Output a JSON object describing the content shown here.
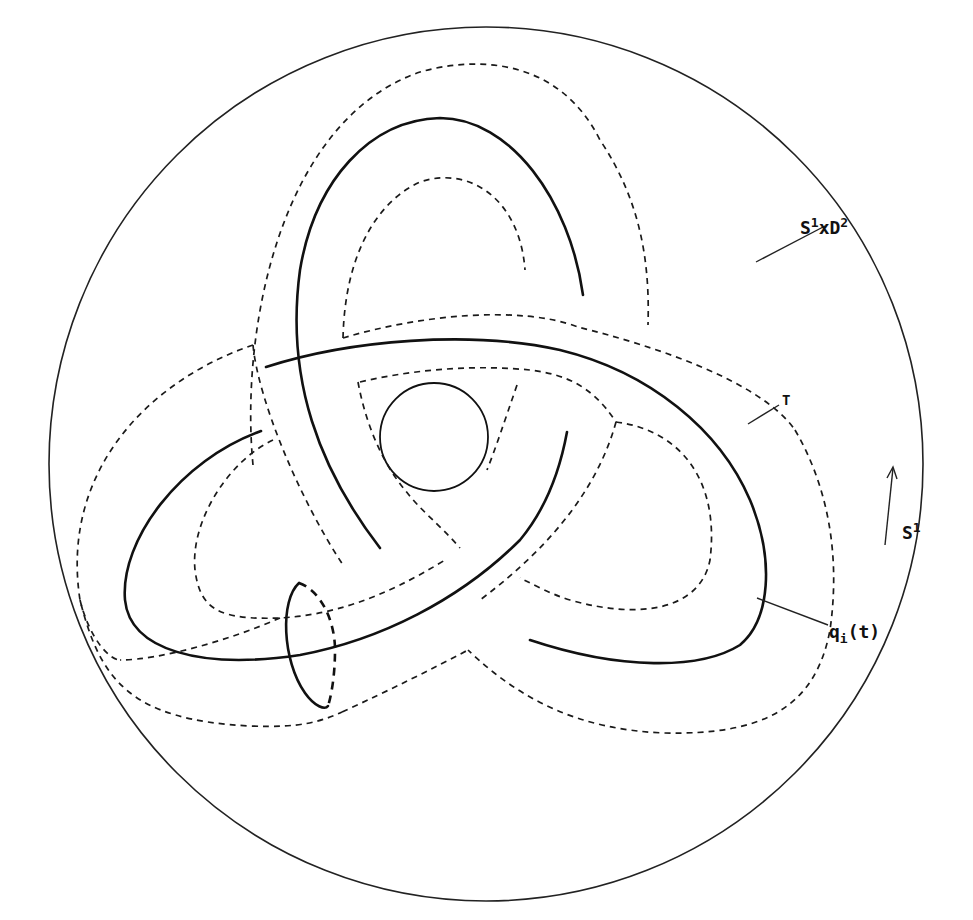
{
  "figure": {
    "type": "trefoil knot tube inside solid torus (cross-section view)",
    "labels": {
      "solid_torus": {
        "base": "S",
        "sup1": "1",
        "mid": "xD",
        "sup2": "2"
      },
      "torus": "T",
      "circle_direction": {
        "base": "S",
        "sup": "1"
      },
      "curve": {
        "base": "q",
        "sub": "i",
        "arg": "(t)"
      }
    },
    "colors": {
      "stroke": "#111111",
      "background": "#ffffff"
    }
  }
}
